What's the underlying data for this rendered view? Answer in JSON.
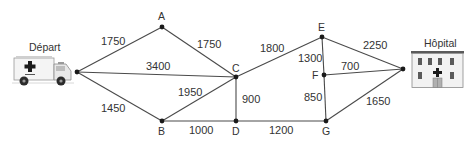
{
  "start": {
    "label": "Départ",
    "icon": "ambulance-icon"
  },
  "end": {
    "label": "Hôpital",
    "icon": "hospital-icon"
  },
  "nodes": [
    {
      "id": "S",
      "label": "",
      "x": 77,
      "y": 72
    },
    {
      "id": "A",
      "label": "A",
      "x": 162,
      "y": 27
    },
    {
      "id": "B",
      "label": "B",
      "x": 162,
      "y": 121
    },
    {
      "id": "C",
      "label": "C",
      "x": 236,
      "y": 77
    },
    {
      "id": "D",
      "label": "D",
      "x": 236,
      "y": 121
    },
    {
      "id": "E",
      "label": "E",
      "x": 322,
      "y": 37
    },
    {
      "id": "F",
      "label": "F",
      "x": 324,
      "y": 75
    },
    {
      "id": "G",
      "label": "G",
      "x": 326,
      "y": 121
    },
    {
      "id": "H",
      "label": "",
      "x": 403,
      "y": 69
    }
  ],
  "edges": [
    {
      "from": "S",
      "to": "A",
      "weight": "1750"
    },
    {
      "from": "S",
      "to": "C",
      "weight": "3400"
    },
    {
      "from": "S",
      "to": "B",
      "weight": "1450"
    },
    {
      "from": "A",
      "to": "C",
      "weight": "1750"
    },
    {
      "from": "B",
      "to": "C",
      "weight": "1950"
    },
    {
      "from": "B",
      "to": "D",
      "weight": "1000"
    },
    {
      "from": "C",
      "to": "D",
      "weight": "900"
    },
    {
      "from": "C",
      "to": "E",
      "weight": "1800"
    },
    {
      "from": "D",
      "to": "G",
      "weight": "1200"
    },
    {
      "from": "E",
      "to": "F",
      "weight": "1300"
    },
    {
      "from": "F",
      "to": "G",
      "weight": "850"
    },
    {
      "from": "E",
      "to": "H",
      "weight": "2250"
    },
    {
      "from": "F",
      "to": "H",
      "weight": "700"
    },
    {
      "from": "G",
      "to": "H",
      "weight": "1650"
    }
  ],
  "colors": {
    "edge": "#4a4a4a",
    "node": "#1a1a1a",
    "text": "#333333",
    "cross": "#1a1a1a"
  }
}
